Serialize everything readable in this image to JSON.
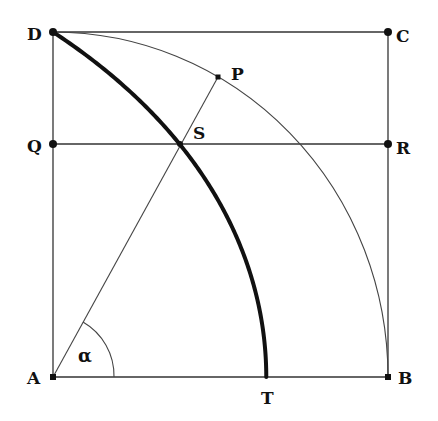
{
  "diagram": {
    "colors": {
      "stroke": "#222222",
      "background": "#ffffff"
    },
    "points": {
      "D": {
        "label": "D",
        "x": 53,
        "y": 32
      },
      "C": {
        "label": "C",
        "x": 388,
        "y": 32
      },
      "Q": {
        "label": "Q",
        "x": 53,
        "y": 144
      },
      "R": {
        "label": "R",
        "x": 388,
        "y": 144
      },
      "A": {
        "label": "A",
        "x": 53,
        "y": 377
      },
      "B": {
        "label": "B",
        "x": 388,
        "y": 377
      },
      "P": {
        "label": "P",
        "x": 218,
        "y": 77
      },
      "S": {
        "label": "S",
        "x": 180,
        "y": 144
      },
      "T": {
        "label": "T",
        "x": 267,
        "y": 377
      }
    },
    "angle_label": "α",
    "elements": [
      "square ABCD",
      "circular arc DB centered at A",
      "horizontal line QR",
      "ray AP intersecting QR at S",
      "quadratrix curve D–S–T (thick)",
      "angle α at A between AB and AP"
    ]
  }
}
